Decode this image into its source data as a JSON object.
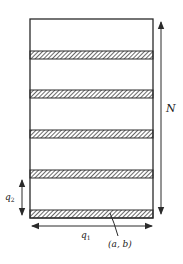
{
  "diagram": {
    "colors": {
      "line": "#2a2a2a",
      "hatch": "#444444",
      "background": "#ffffff"
    },
    "labels": {
      "height": "N",
      "period_vertical": "q",
      "period_vertical_sub": "2",
      "period_horizontal": "q",
      "period_horizontal_sub": "1",
      "point": "(a, b)"
    },
    "stripes": [
      {
        "index": 1,
        "y": 51
      },
      {
        "index": 2,
        "y": 90
      },
      {
        "index": 3,
        "y": 130
      },
      {
        "index": 4,
        "y": 170
      },
      {
        "index": 5,
        "y": 210
      }
    ]
  }
}
